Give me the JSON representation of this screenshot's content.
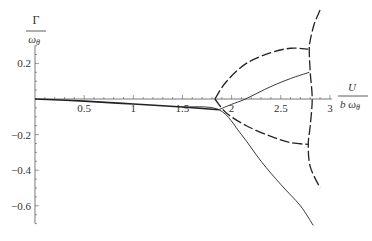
{
  "chart_data": {
    "type": "line",
    "title": "",
    "xlabel": "U / (b ω_θ)",
    "ylabel": "Γ / ω_θ",
    "xlabel_parts": {
      "numerator": "U",
      "denominator": "b ω",
      "subscript": "θ"
    },
    "ylabel_parts": {
      "numerator": "Γ",
      "denominator": "ω",
      "subscript": "θ"
    },
    "xlim": [
      0,
      3
    ],
    "ylim": [
      -0.7,
      0.5
    ],
    "x_ticks": [
      0.5,
      1,
      1.5,
      2,
      2.5,
      3
    ],
    "x_tick_labels": [
      "0.5",
      "1",
      "1.5",
      "2",
      "2.5",
      "3"
    ],
    "y_ticks": [
      0.2,
      -0.2,
      -0.4,
      -0.6
    ],
    "y_tick_labels": [
      "0.2",
      "-0.2",
      "-0.4",
      "-0.6"
    ],
    "grid": false,
    "legend": null,
    "series": [
      {
        "name": "solid-shared",
        "style": "solid",
        "points": [
          [
            0,
            0
          ],
          [
            0.5,
            -0.012
          ],
          [
            1,
            -0.028
          ],
          [
            1.5,
            -0.045
          ],
          [
            1.87,
            -0.06
          ]
        ]
      },
      {
        "name": "solid-upper-branch",
        "style": "solid",
        "points": [
          [
            1.87,
            -0.06
          ],
          [
            2.0,
            -0.03
          ],
          [
            2.14,
            0.0
          ],
          [
            2.4,
            0.07
          ],
          [
            2.6,
            0.115
          ],
          [
            2.79,
            0.15
          ]
        ]
      },
      {
        "name": "solid-lower-branch",
        "style": "solid",
        "points": [
          [
            1.5,
            -0.045
          ],
          [
            1.87,
            -0.06
          ],
          [
            2.1,
            -0.2
          ],
          [
            2.3,
            -0.35
          ],
          [
            2.5,
            -0.48
          ],
          [
            2.7,
            -0.6
          ],
          [
            2.83,
            -0.71
          ]
        ]
      },
      {
        "name": "dashed-upper",
        "style": "dashed",
        "points": [
          [
            1.83,
            0.0
          ],
          [
            1.95,
            0.1
          ],
          [
            2.15,
            0.2
          ],
          [
            2.4,
            0.26
          ],
          [
            2.6,
            0.285
          ],
          [
            2.78,
            0.28
          ]
        ]
      },
      {
        "name": "dashed-lower",
        "style": "dashed",
        "points": [
          [
            1.83,
            0.0
          ],
          [
            1.95,
            -0.08
          ],
          [
            2.15,
            -0.15
          ],
          [
            2.4,
            -0.21
          ],
          [
            2.6,
            -0.245
          ],
          [
            2.78,
            -0.255
          ]
        ]
      },
      {
        "name": "dashed-vertical",
        "style": "dashed",
        "points": [
          [
            2.9,
            0.5
          ],
          [
            2.84,
            0.42
          ],
          [
            2.8,
            0.33
          ],
          [
            2.79,
            0.28
          ],
          [
            2.8,
            0.15
          ],
          [
            2.82,
            0.0
          ],
          [
            2.8,
            -0.15
          ],
          [
            2.78,
            -0.255
          ],
          [
            2.8,
            -0.38
          ],
          [
            2.9,
            -0.5
          ]
        ]
      }
    ]
  }
}
